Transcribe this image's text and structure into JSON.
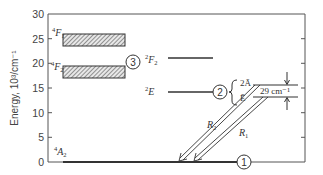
{
  "axis": {
    "ylabel": "Energy, 10³/cm⁻¹",
    "ticks": [
      "30",
      "25",
      "20",
      "15",
      "10",
      "5",
      "0"
    ]
  },
  "levels": {
    "f1": {
      "sup": "4",
      "main": "F",
      "sub": "1"
    },
    "f2_quartet": {
      "sup": "4",
      "main": "F",
      "sub": "2"
    },
    "f2_doublet": {
      "sup": "2",
      "main": "F",
      "sub": "2"
    },
    "e_doublet": {
      "sup": "2",
      "main": "E"
    },
    "a2": {
      "sup": "4",
      "main": "A",
      "sub": "2"
    },
    "two_a_bar": "2Ā",
    "e_bar": "Ē"
  },
  "splitting_label": "29 cm⁻¹",
  "transitions": {
    "r1": {
      "main": "R",
      "sub": "1"
    },
    "r2": {
      "main": "R",
      "sub": "2"
    }
  },
  "markers": [
    "1",
    "2",
    "3"
  ],
  "colors": {
    "line": "#333333",
    "hatch": "#555555",
    "frame": "#555555"
  }
}
